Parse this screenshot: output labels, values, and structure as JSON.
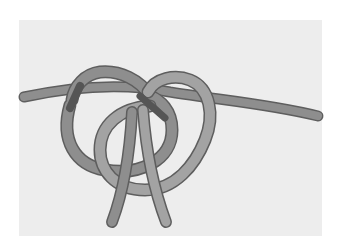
{
  "image": {
    "subject": "knot illustration",
    "description": "Gray rope tied in a knot with two loops and two hanging ends",
    "colors": {
      "background": "#ffffff",
      "panel": "#ededed",
      "rope_dark": "#8a8a8a",
      "rope_light": "#a3a3a3",
      "rope_outline": "#5e5e5e",
      "shadow": "#555555"
    }
  }
}
